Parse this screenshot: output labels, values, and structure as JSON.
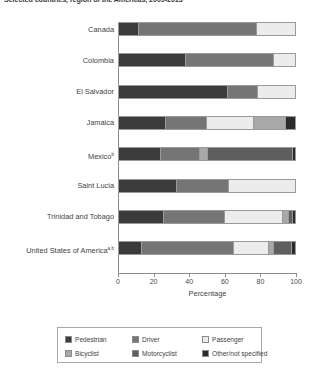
{
  "title": "Selected countries, region of the Americas, 2009-2013",
  "axis": {
    "x_label": "Percentage",
    "ticks": [
      0,
      20,
      40,
      60,
      80,
      100
    ],
    "xlim": [
      0,
      100
    ]
  },
  "legend": {
    "items": [
      {
        "label": "Pedestrian",
        "color": "#3b3b3b"
      },
      {
        "label": "Driver",
        "color": "#757575"
      },
      {
        "label": "Passenger",
        "color": "#ececec"
      },
      {
        "label": "Bicyclist",
        "color": "#a8a8a8"
      },
      {
        "label": "Motorcyclist",
        "color": "#5e5e5e"
      },
      {
        "label": "Other/not specified",
        "color": "#2b2b2b"
      }
    ]
  },
  "chart_data": {
    "type": "bar",
    "orientation": "horizontal",
    "stacked": true,
    "title": "Selected countries, region of the Americas, 2009-2013",
    "xlabel": "Percentage",
    "ylabel": "",
    "xlim": [
      0,
      100
    ],
    "xticks": [
      0,
      20,
      40,
      60,
      80,
      100
    ],
    "grid": false,
    "legend_position": "bottom",
    "categories": [
      "Canada",
      "Colombia",
      "El Salvador",
      "Jamaica",
      "Mexico",
      "Saint Lucia",
      "Trinidad and Tobago",
      "United States of America"
    ],
    "category_footnotes": {
      "Mexico": "b",
      "United States of America": "a,b"
    },
    "series": [
      {
        "name": "Pedestrian",
        "color": "#3b3b3b",
        "values": [
          11,
          38,
          62,
          27,
          24,
          33,
          26,
          13
        ]
      },
      {
        "name": "Driver",
        "color": "#757575",
        "values": [
          67,
          50,
          17,
          23,
          22,
          29,
          35,
          53
        ]
      },
      {
        "name": "Passenger",
        "color": "#ececec",
        "values": [
          22,
          12,
          21,
          27,
          0,
          38,
          33,
          20
        ]
      },
      {
        "name": "Bicyclist",
        "color": "#a8a8a8",
        "values": [
          0,
          0,
          0,
          18,
          4,
          0,
          3,
          2
        ]
      },
      {
        "name": "Motorcyclist",
        "color": "#5e5e5e",
        "values": [
          0,
          0,
          0,
          0,
          49,
          0,
          2,
          10
        ]
      },
      {
        "name": "Other/not specified",
        "color": "#2b2b2b",
        "values": [
          0,
          0,
          0,
          5,
          1,
          0,
          1,
          2
        ]
      }
    ]
  }
}
